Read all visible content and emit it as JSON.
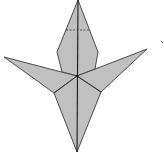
{
  "diagram": {
    "type": "origami-fold-diagram",
    "subject": "origami crane / bird base step",
    "colors": {
      "paper_fill": "#c0c0c0",
      "edge_stroke": "#3a3a3a",
      "crease_stroke": "#1a1a1a",
      "background": "#ffffff"
    },
    "shapes": {
      "head_diamond": {
        "points": [
          [
            78,
            0
          ],
          [
            98,
            52
          ],
          [
            95,
            69
          ],
          [
            77,
            76
          ],
          [
            62,
            72
          ],
          [
            57,
            52
          ]
        ]
      },
      "left_wing": {
        "points": [
          [
            4,
            57
          ],
          [
            77,
            76
          ],
          [
            54,
            93
          ]
        ]
      },
      "right_wing": {
        "points": [
          [
            147,
            49
          ],
          [
            101,
            92
          ],
          [
            77,
            76
          ]
        ]
      },
      "lower_tail": {
        "points": [
          [
            77,
            76
          ],
          [
            101,
            92
          ],
          [
            77,
            152
          ],
          [
            54,
            93
          ]
        ]
      }
    },
    "creases": {
      "center_line": [
        [
          78,
          0
        ],
        [
          77,
          152
        ]
      ],
      "left_lower_crease": [
        [
          77,
          76
        ],
        [
          54,
          93
        ]
      ],
      "right_lower_crease": [
        [
          77,
          76
        ],
        [
          101,
          92
        ]
      ],
      "fold_dash_line": [
        [
          66,
          30
        ],
        [
          89,
          30
        ]
      ]
    },
    "marks": {
      "stray_mark": [
        162,
        42
      ]
    }
  }
}
